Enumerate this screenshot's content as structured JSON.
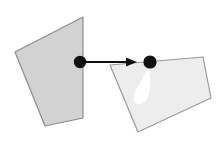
{
  "canvas": {
    "width": 222,
    "height": 144,
    "background_color": "#ffffff"
  },
  "figure": {
    "title": "Two quadrilateral planes linked by a transfer arrow"
  },
  "colors": {
    "left_plane_fill": "#d2d2d2",
    "left_plane_stroke": "#8c8c8c",
    "right_plane_fill": "#ededed",
    "right_plane_stroke": "#9a9a9a",
    "blob_fill": "#ffffff",
    "dot_fill": "#111111",
    "arrow_color": "#111111",
    "background": "#ffffff"
  },
  "shapes": {
    "left_plane": {
      "label": "left quadrilateral plane",
      "points": "83,17 15,52 45,126 83,118",
      "fill": "#d2d2d2",
      "stroke": "#8c8c8c",
      "stroke_width": 1.2
    },
    "right_plane": {
      "label": "right quadrilateral plane",
      "points": "110,65 203,57 211,98 138,132",
      "fill": "#ededed",
      "stroke": "#9a9a9a",
      "stroke_width": 1.2
    },
    "white_blob": {
      "label": "white teardrop highlight",
      "path": "M149,63 C146,72 141,82 136,90 C131,99 134,105 140,104 C147,103 150,94 150,85 C150,76 150,69 149,63 Z",
      "fill": "#ffffff"
    }
  },
  "markers": {
    "left_dot": {
      "label": "source point",
      "cx": 80,
      "cy": 62,
      "r": 6.2,
      "fill": "#111111"
    },
    "right_dot": {
      "label": "target point",
      "cx": 150,
      "cy": 62,
      "r": 6.6,
      "fill": "#111111"
    }
  },
  "arrow": {
    "label": "mapping arrow",
    "x1": 86,
    "y1": 62,
    "x2": 128,
    "y2": 62,
    "stroke_width": 2.2,
    "head_path": "M126,57.5 L137,62 L126,66.5 Z",
    "color": "#111111"
  }
}
